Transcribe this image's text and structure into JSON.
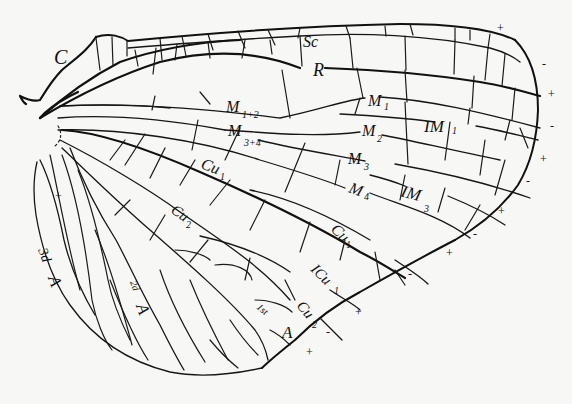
{
  "figure": {
    "labels": {
      "costa": "C",
      "subcosta": "Sc",
      "radius": "R",
      "m12": {
        "base": "M",
        "sub": "1+2"
      },
      "m34": {
        "base": "M",
        "sub": "3+4"
      },
      "m1": {
        "base": "M",
        "sub": "1"
      },
      "m2": {
        "base": "M",
        "sub": "2"
      },
      "m3": {
        "base": "M",
        "sub": "3"
      },
      "m4": {
        "base": "M",
        "sub": "4"
      },
      "im1": {
        "base": "IM",
        "sub": "1"
      },
      "im3": {
        "base": "IM",
        "sub": "3"
      },
      "cu1_inner": {
        "base": "Cu",
        "sub": "1"
      },
      "cu1_outer": {
        "base": "Cu",
        "sub": "1"
      },
      "cu2": {
        "base": "Cu",
        "sub": "2"
      },
      "icu1": {
        "base": "ICu",
        "sub": "1"
      },
      "cu2_distal": {
        "base": "Cu",
        "sub": "2"
      },
      "first_anal": {
        "prefix": "1st",
        "base": "A"
      },
      "second_anal": {
        "prefix": "2d",
        "base": "A"
      },
      "third_anal": {
        "prefix": "3d",
        "base": "A"
      }
    },
    "margin_signs": [
      "+",
      "-",
      "+",
      "-",
      "+",
      "-",
      "+",
      "-",
      "+",
      "-",
      "+",
      "-",
      "+",
      "+"
    ]
  }
}
